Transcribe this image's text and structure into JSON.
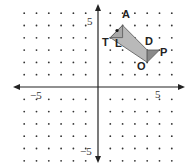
{
  "diagram": {
    "type": "coordinate-grid",
    "x_range": [
      -6,
      6
    ],
    "y_range": [
      -6,
      6
    ],
    "tick_labels": {
      "x_neg": "−5",
      "x_pos": "5",
      "y_pos": "5",
      "y_neg": "−5"
    },
    "shape": {
      "fill_main": "#b9b9b9",
      "fill_dark": "#8a8a8a",
      "stroke": "#555555",
      "vertices": {
        "A": [
          2,
          5
        ],
        "T": [
          1,
          4
        ],
        "L": [
          2,
          4
        ],
        "D": [
          4,
          3
        ],
        "P": [
          5,
          3
        ],
        "O": [
          4,
          2
        ]
      }
    },
    "point_labels": {
      "A": "A",
      "T": "T",
      "L": "L",
      "D": "D",
      "P": "P",
      "O": "O"
    }
  }
}
